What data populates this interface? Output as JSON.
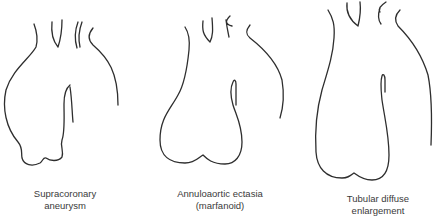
{
  "figures": [
    {
      "id": "supracoronary",
      "label_line1": "Supracoronary",
      "label_line2": "aneurysm"
    },
    {
      "id": "annuloaortic",
      "label_line1": "Annuloaortic ectasia",
      "label_line2": "(marfanoid)"
    },
    {
      "id": "tubular",
      "label_line1": "Tubular diffuse",
      "label_line2": "enlargement"
    }
  ],
  "colors": {
    "stroke": "#2e2e2e",
    "text": "#3a3a3a",
    "background": "#ffffff"
  }
}
